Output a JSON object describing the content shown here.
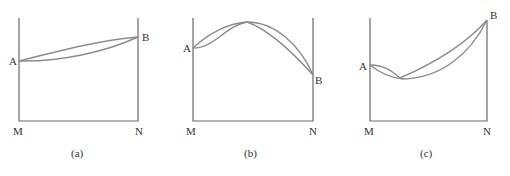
{
  "figure": {
    "panels": [
      {
        "id": "a",
        "caption": "(a)",
        "left_label": "A",
        "right_label": "B",
        "bottom_left": "M",
        "bottom_right": "N"
      },
      {
        "id": "b",
        "caption": "(b)",
        "left_label": "A",
        "right_label": "B",
        "bottom_left": "M",
        "bottom_right": "N"
      },
      {
        "id": "c",
        "caption": "(c)",
        "left_label": "A",
        "right_label": "B",
        "bottom_left": "M",
        "bottom_right": "N"
      }
    ],
    "colors": {
      "axis": "#6b6b6b",
      "curve": "#8c8c8c",
      "text": "#333333"
    }
  }
}
